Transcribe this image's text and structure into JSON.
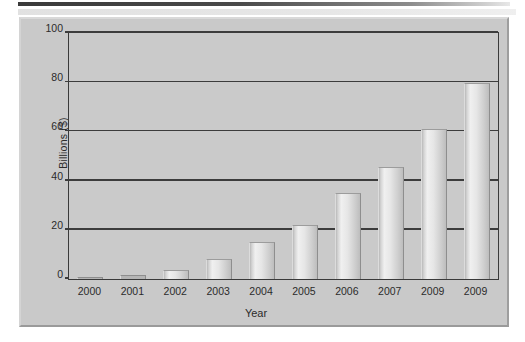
{
  "figure": {
    "background_color": "#c9c9c9",
    "plot_background_color": "#cacaca",
    "axis_color": "#3a3a3a",
    "bar_fill_light": "#f0f0f0",
    "bar_fill_dark": "#bdbdbd"
  },
  "chart_data": {
    "type": "bar",
    "title": "",
    "xlabel": "Year",
    "ylabel": "Billions ($)",
    "categories": [
      "2000",
      "2001",
      "2002",
      "2003",
      "2004",
      "2005",
      "2006",
      "2007",
      "2009",
      "2009"
    ],
    "values": [
      0,
      1.5,
      3.5,
      8,
      15,
      22,
      35,
      45.5,
      61,
      79.5
    ],
    "ylim": [
      0,
      100
    ],
    "yticks": [
      0,
      20,
      40,
      60,
      80,
      100
    ],
    "ytick_labels": [
      "0",
      "20",
      "40",
      "60",
      "80",
      "100"
    ],
    "grid": true,
    "grid_axis": "y",
    "legend": false,
    "legend_position": "none"
  }
}
